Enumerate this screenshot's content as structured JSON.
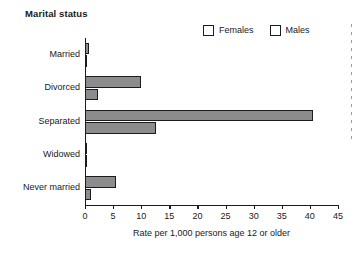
{
  "chart_data": {
    "type": "bar",
    "orientation": "horizontal",
    "title": "Marital status",
    "xlabel": "Rate per 1,000 persons age 12 or older",
    "ylabel": "",
    "xlim": [
      0,
      45
    ],
    "xticks": [
      0,
      5,
      10,
      15,
      20,
      25,
      30,
      35,
      40,
      45
    ],
    "grid": false,
    "legend_position": "top-right",
    "categories": [
      "Married",
      "Divorced",
      "Separated",
      "Widowed",
      "Never married"
    ],
    "series": [
      {
        "name": "Females",
        "color": "#8c8c8c",
        "values": [
          0.8,
          10.0,
          40.5,
          0.4,
          5.5
        ]
      },
      {
        "name": "Males",
        "color": "#8c8c8c",
        "values": [
          0.2,
          2.3,
          12.7,
          0.1,
          1.0
        ]
      }
    ]
  },
  "legend": {
    "entries": [
      {
        "label": "Females",
        "swatch_color": "#8c8c8c"
      },
      {
        "label": "Males",
        "swatch_color": "#909090"
      }
    ]
  },
  "axis": {
    "x_title": "Rate per 1,000 persons age 12 or older",
    "tick_labels": [
      "0",
      "5",
      "10",
      "15",
      "20",
      "25",
      "30",
      "35",
      "40",
      "45"
    ]
  },
  "colors": {
    "bar_fill": "#8c8c8c",
    "bar_stroke": "#1c1c1c",
    "axis": "#1c1c1c",
    "text": "#1a1a1a",
    "background": "#ffffff"
  }
}
